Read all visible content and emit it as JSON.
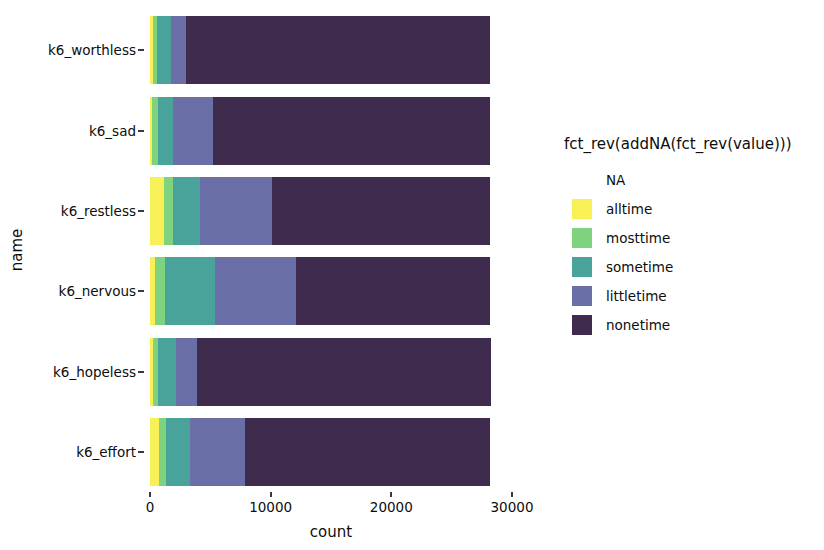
{
  "chart_data": {
    "type": "bar",
    "orientation": "horizontal",
    "stacked": true,
    "title": "",
    "xlabel": "count",
    "ylabel": "name",
    "xlim": [
      0,
      30000
    ],
    "xticks": [
      0,
      10000,
      20000,
      30000
    ],
    "xticklabels": [
      "0",
      "10000",
      "20000",
      "30000"
    ],
    "grid": false,
    "legend_position": "right",
    "legend_title": "fct_rev(addNA(fct_rev(value)))",
    "categories": [
      "k6_worthless",
      "k6_sad",
      "k6_restless",
      "k6_nervous",
      "k6_hopeless",
      "k6_effort"
    ],
    "series": [
      {
        "name": "NA",
        "color": "#ffffff",
        "values": [
          0,
          0,
          0,
          0,
          0,
          0
        ]
      },
      {
        "name": "alltime",
        "color": "#f7f056",
        "values": [
          210,
          200,
          1160,
          430,
          220,
          720
        ]
      },
      {
        "name": "mosttime",
        "color": "#7fd37f",
        "values": [
          400,
          430,
          750,
          810,
          410,
          600
        ]
      },
      {
        "name": "sometime",
        "color": "#4aa39b",
        "values": [
          1090,
          1260,
          2230,
          4140,
          1490,
          2030
        ]
      },
      {
        "name": "littletime",
        "color": "#6a6fa8",
        "values": [
          1250,
          3320,
          5960,
          6720,
          1780,
          4560
        ]
      },
      {
        "name": "nonetime",
        "color": "#3f2b4d",
        "values": [
          25250,
          23000,
          18100,
          16100,
          24400,
          20300
        ]
      }
    ],
    "totals": [
      28200,
      28210,
      28200,
      28200,
      28300,
      28210
    ]
  },
  "axes": {
    "y_title": "name",
    "x_title": "count",
    "y_tick_labels": [
      "k6_worthless",
      "k6_sad",
      "k6_restless",
      "k6_nervous",
      "k6_hopeless",
      "k6_effort"
    ],
    "x_tick_labels": [
      "0",
      "10000",
      "20000",
      "30000"
    ]
  },
  "legend": {
    "title": "fct_rev(addNA(fct_rev(value)))",
    "items": [
      {
        "label": "NA",
        "color": "#ffffff"
      },
      {
        "label": "alltime",
        "color": "#f7f056"
      },
      {
        "label": "mosttime",
        "color": "#7fd37f"
      },
      {
        "label": "sometime",
        "color": "#4aa39b"
      },
      {
        "label": "littletime",
        "color": "#6a6fa8"
      },
      {
        "label": "nonetime",
        "color": "#3f2b4d"
      }
    ]
  }
}
